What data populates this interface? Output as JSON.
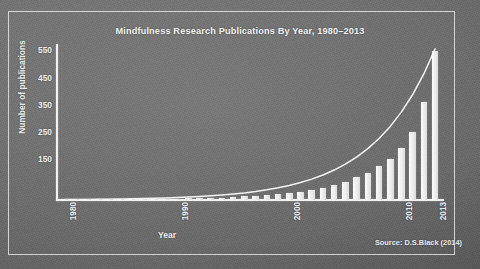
{
  "slide": {
    "source_note": "Source: D.S.Black (2014)"
  },
  "chart_data": {
    "type": "bar",
    "title": "Mindfulness Research Publications By Year, 1980–2013",
    "xlabel": "Year",
    "ylabel": "Number of publications",
    "x": [
      1980,
      1981,
      1982,
      1983,
      1984,
      1985,
      1986,
      1987,
      1988,
      1989,
      1990,
      1991,
      1992,
      1993,
      1994,
      1995,
      1996,
      1997,
      1998,
      1999,
      2000,
      2001,
      2002,
      2003,
      2004,
      2005,
      2006,
      2007,
      2008,
      2009,
      2010,
      2011,
      2012,
      2013
    ],
    "values": [
      1,
      1,
      1,
      2,
      2,
      2,
      3,
      3,
      4,
      4,
      5,
      6,
      7,
      8,
      9,
      11,
      13,
      15,
      18,
      22,
      26,
      31,
      38,
      46,
      56,
      68,
      83,
      101,
      124,
      152,
      190,
      250,
      360,
      549
    ],
    "categories": [
      "1980",
      "1981",
      "1982",
      "1983",
      "1984",
      "1985",
      "1986",
      "1987",
      "1988",
      "1989",
      "1990",
      "1991",
      "1992",
      "1993",
      "1994",
      "1995",
      "1996",
      "1997",
      "1998",
      "1999",
      "2000",
      "2001",
      "2002",
      "2003",
      "2004",
      "2005",
      "2006",
      "2007",
      "2008",
      "2009",
      "2010",
      "2011",
      "2012",
      "2013"
    ],
    "xtick_labels": [
      "1980",
      "1990",
      "2000",
      "2010",
      "2013"
    ],
    "xtick_values": [
      1980,
      1990,
      2000,
      2010,
      2013
    ],
    "ytick_labels": [
      "150",
      "250",
      "350",
      "450",
      "550"
    ],
    "ytick_values": [
      150,
      250,
      350,
      450,
      550
    ],
    "ylim": [
      0,
      570
    ],
    "xlim": [
      1979.3,
      2013.7
    ],
    "grid": false,
    "legend": "none",
    "series": [
      {
        "name": "Publications per year",
        "type": "bar",
        "values": [
          1,
          1,
          1,
          2,
          2,
          2,
          3,
          3,
          4,
          4,
          5,
          6,
          7,
          8,
          9,
          11,
          13,
          15,
          18,
          22,
          26,
          31,
          38,
          46,
          56,
          68,
          83,
          101,
          124,
          152,
          190,
          250,
          360,
          549
        ]
      },
      {
        "name": "Exponential trend",
        "type": "line",
        "values": [
          1.5,
          1.8,
          2.1,
          2.5,
          3.0,
          3.6,
          4.3,
          5.2,
          6.2,
          7.4,
          8.9,
          10.6,
          12.7,
          15.2,
          18.2,
          21.8,
          26.1,
          31.2,
          37.4,
          44.8,
          53.6,
          64.2,
          76.8,
          92.0,
          110.1,
          131.8,
          157.8,
          188.9,
          226.1,
          270.7,
          324.0,
          387.9,
          464.4,
          556.0
        ]
      }
    ],
    "colors": {
      "bar": "#ededed",
      "curve": "#f2f2f2",
      "axis": "#f2f2f2",
      "text": "#ececec",
      "background": "#6e6e6e",
      "frame": "#eeeeee"
    }
  }
}
